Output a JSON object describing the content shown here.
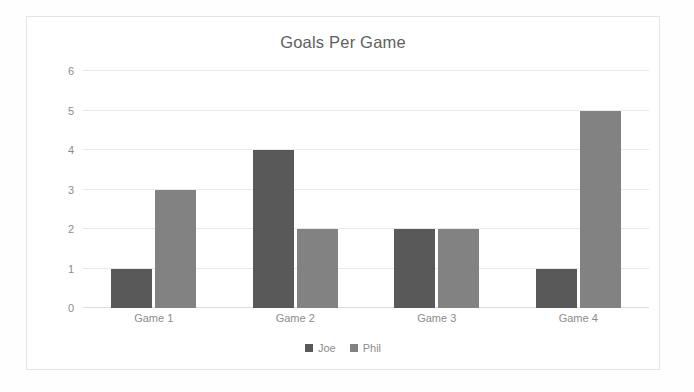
{
  "chart_data": {
    "type": "bar",
    "title": "Goals Per Game",
    "categories": [
      "Game 1",
      "Game 2",
      "Game 3",
      "Game 4"
    ],
    "series": [
      {
        "name": "Joe",
        "values": [
          1,
          4,
          2,
          1
        ],
        "color": "#595959"
      },
      {
        "name": "Phil",
        "values": [
          3,
          2,
          2,
          5
        ],
        "color": "#828282"
      }
    ],
    "xlabel": "",
    "ylabel": "",
    "ylim": [
      0,
      6
    ],
    "yticks": [
      0,
      1,
      2,
      3,
      4,
      5,
      6
    ],
    "ytick_labels": [
      "0",
      "1",
      "2",
      "3",
      "4",
      "5",
      "6"
    ],
    "grid": true,
    "grid_axis": "y",
    "grid_color": "#e9e9e9",
    "legend": true,
    "legend_position": "bottom",
    "background_color": "#ffffff",
    "border_color": "#e4e4e4",
    "title_color": "#606060",
    "tick_label_color": "#8c8c8c"
  }
}
